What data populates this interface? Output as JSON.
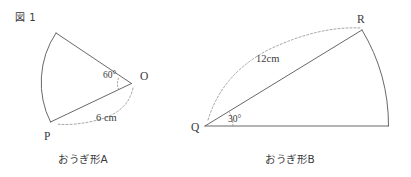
{
  "page": {
    "figure_label": "図 1",
    "background_color": "#ffffff",
    "ink_color": "#3a3a3a",
    "solid_line_color": "#57575a",
    "dashed_line_color": "#8d8d90"
  },
  "figures": [
    {
      "id": "sector-a",
      "caption": "おうぎ形A",
      "center_label": "O",
      "arc_point_label": "P",
      "angle_label": "60°",
      "radius_label": "6 cm",
      "angle_degrees": 60,
      "radius_cm": 6
    },
    {
      "id": "sector-b",
      "caption": "おうぎ形B",
      "center_label": "Q",
      "arc_point_label": "R",
      "angle_label": "30°",
      "radius_label": "12cm",
      "angle_degrees": 30,
      "radius_cm": 12
    }
  ]
}
